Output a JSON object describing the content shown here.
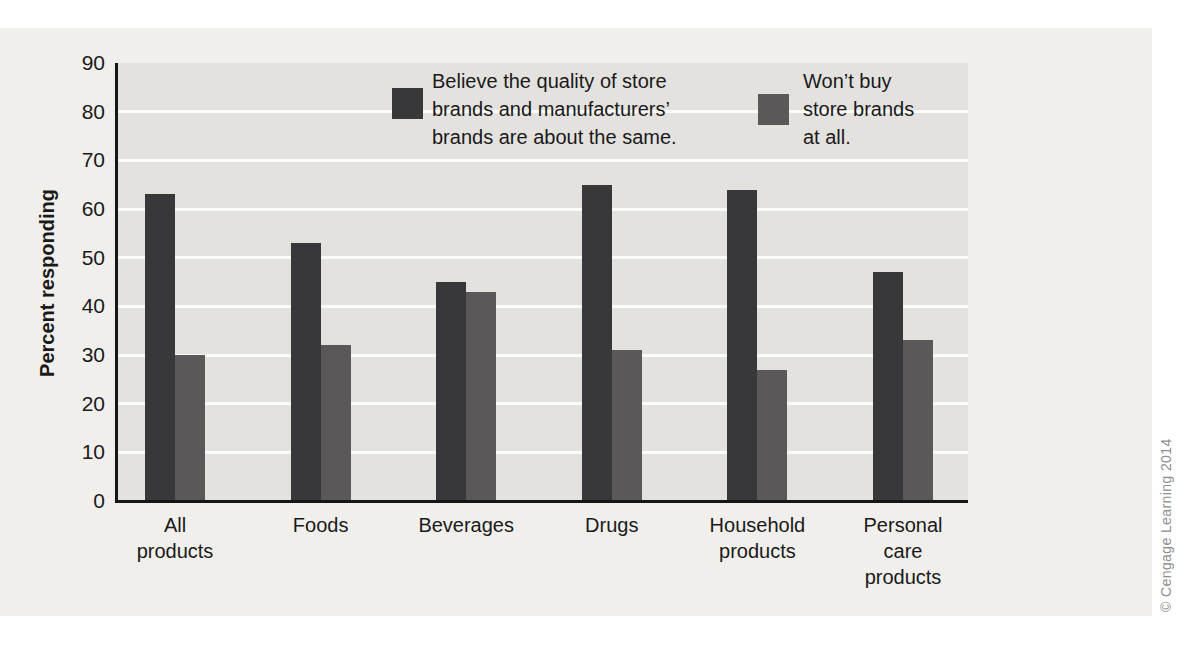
{
  "figure": {
    "background_color": "#f0efeb",
    "plot_background_color": "#e3e2df",
    "gridline_color": "#fbfbf9",
    "axis_color": "#161616",
    "copyright": "© Cengage Learning 2014"
  },
  "chart_data": {
    "type": "bar",
    "title": "",
    "xlabel": "",
    "ylabel": "Percent responding",
    "ylim": [
      0,
      90
    ],
    "ytick_step": 10,
    "grid": "horizontal white gridlines at 10-80",
    "legend_position": "top inside plot, two entries side by side",
    "categories": [
      "All\nproducts",
      "Foods",
      "Beverages",
      "Drugs",
      "Household\nproducts",
      "Personal\ncare\nproducts"
    ],
    "series": [
      {
        "name": "Believe the quality of store\nbrands and manufacturers’\nbrands are about the same.",
        "color": "#38373a",
        "values": [
          63,
          53,
          45,
          65,
          64,
          47
        ]
      },
      {
        "name": "Won’t buy\nstore brands\nat all.",
        "color": "#5b585a",
        "values": [
          30,
          32,
          43,
          31,
          27,
          33
        ]
      }
    ]
  }
}
